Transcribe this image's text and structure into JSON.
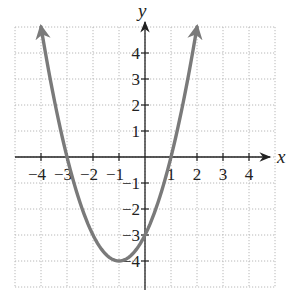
{
  "chart_data": {
    "type": "line",
    "title": "",
    "xlabel": "x",
    "ylabel": "y",
    "xlim": [
      -5,
      5
    ],
    "ylim": [
      -5,
      5
    ],
    "grid": true,
    "x_ticks": [
      -4,
      -3,
      -2,
      -1,
      1,
      2,
      3,
      4
    ],
    "y_ticks": [
      -4,
      -3,
      -2,
      -1,
      1,
      2,
      3,
      4
    ],
    "x_tick_labels": [
      "−4",
      "−3",
      "−2",
      "−1",
      "1",
      "2",
      "3",
      "4"
    ],
    "y_tick_labels": [
      "−4",
      "−3",
      "−2",
      "−1",
      "1",
      "2",
      "3",
      "4"
    ],
    "series": [
      {
        "name": "y = x^2 + 2x - 3",
        "function": "x^2 + 2x - 3",
        "domain": [
          -4,
          2
        ],
        "arrows_at_ends": true,
        "color": "#7a7a7a",
        "x": [
          -4,
          -3,
          -2,
          -1,
          0,
          1,
          2
        ],
        "values": [
          5,
          0,
          -3,
          -4,
          -3,
          0,
          5
        ]
      }
    ],
    "key_points": {
      "vertex": [
        -1,
        -4
      ],
      "x_intercepts": [
        -3,
        1
      ],
      "y_intercept": -3
    }
  },
  "labels": {
    "x_axis": "x",
    "y_axis": "y"
  }
}
